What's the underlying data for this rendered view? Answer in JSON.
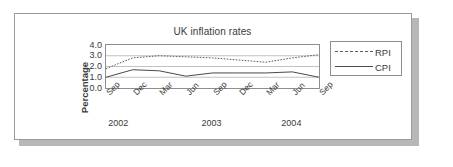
{
  "chart_data": {
    "type": "line",
    "title": "UK inflation rates",
    "xlabel": "",
    "ylabel": "Percentage",
    "ylim": [
      0.0,
      4.0
    ],
    "yticks": [
      "0.0",
      "1.0",
      "2.0",
      "3.0",
      "4.0"
    ],
    "grid": true,
    "legend_position": "right-outside",
    "categories": [
      "Sep",
      "Dec",
      "Mar",
      "Jun",
      "Sep",
      "Dec",
      "Mar",
      "Jun",
      "Sep"
    ],
    "year_groups": [
      {
        "label": "2002",
        "center_index": 0.5
      },
      {
        "label": "2003",
        "center_index": 4.0
      },
      {
        "label": "2004",
        "center_index": 7.0
      }
    ],
    "series": [
      {
        "name": "RPI",
        "style": "dotted",
        "color": "#5c5c5c",
        "values": [
          1.8,
          2.8,
          3.0,
          2.9,
          2.8,
          2.6,
          2.4,
          2.8,
          3.1
        ]
      },
      {
        "name": "CPI",
        "style": "solid",
        "color": "#4a4a4a",
        "values": [
          1.0,
          1.7,
          1.6,
          1.1,
          1.4,
          1.4,
          1.4,
          1.5,
          1.0
        ]
      }
    ]
  },
  "legend": {
    "items": [
      {
        "label": "RPI",
        "style": "dotted"
      },
      {
        "label": "CPI",
        "style": "solid"
      }
    ]
  },
  "colors": {
    "panel_border": "#9a9a9a",
    "panel_shadow": "#b7b7b7",
    "axis": "#8e8e8e",
    "gridline": "#a8a8a8",
    "text": "#3a3a3a",
    "background": "#ffffff"
  }
}
